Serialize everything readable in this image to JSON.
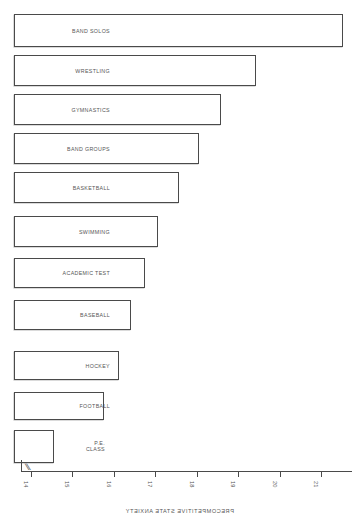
{
  "chart_data": {
    "type": "bar",
    "orientation": "horizontal",
    "title": "",
    "xlabel": "PRECOMPETITIVE STATE ANXIETY",
    "ylabel": "",
    "grid": false,
    "legend": "none",
    "axis_break": true,
    "axis_break_symbol": "//",
    "xlim": [
      14,
      21.8
    ],
    "xticks": [
      21,
      20,
      19,
      18,
      17,
      16,
      15,
      14
    ],
    "xtick_labels": [
      "21",
      "20",
      "19",
      "18",
      "17",
      "16",
      "15",
      "14"
    ],
    "categories": [
      "BAND SOLOS",
      "WRESTLING",
      "GYMNASTICS",
      "BAND GROUPS",
      "BASKETBALL",
      "SWIMMING",
      "ACADEMIC TEST",
      "BASEBALL",
      "HOCKEY",
      "FOOTBALL",
      "P.E.\nCLASS"
    ],
    "values": [
      21.5,
      19.4,
      18.6,
      18.0,
      17.5,
      17.0,
      16.7,
      16.4,
      16.1,
      15.7,
      14.5
    ]
  },
  "bars": [
    {
      "label": "BAND SOLOS",
      "value": 21.5,
      "top": 14,
      "height": 33,
      "left": 16,
      "width": 329,
      "label_x": 249,
      "lines": 1
    },
    {
      "label": "WRESTLING",
      "value": 19.4,
      "top": 55,
      "height": 31,
      "left": 103,
      "width": 242,
      "label_x": 249,
      "lines": 1
    },
    {
      "label": "GYMNASTICS",
      "value": 18.6,
      "top": 94,
      "height": 31,
      "left": 138,
      "width": 207,
      "label_x": 249,
      "lines": 1
    },
    {
      "label": "BAND GROUPS",
      "value": 18.0,
      "top": 133,
      "height": 31,
      "left": 160,
      "width": 185,
      "label_x": 249,
      "lines": 1
    },
    {
      "label": "BASKETBALL",
      "value": 17.5,
      "top": 172,
      "height": 31,
      "left": 180,
      "width": 165,
      "label_x": 249,
      "lines": 1
    },
    {
      "label": "SWIMMING",
      "value": 17.0,
      "top": 216,
      "height": 31,
      "left": 201,
      "width": 144,
      "label_x": 249,
      "lines": 1
    },
    {
      "label": "ACADEMIC TEST",
      "value": 16.7,
      "top": 258,
      "height": 30,
      "left": 214,
      "width": 131,
      "label_x": 249,
      "lines": 1
    },
    {
      "label": "BASEBALL",
      "value": 16.4,
      "top": 300,
      "height": 30,
      "left": 228,
      "width": 117,
      "label_x": 249,
      "lines": 1
    },
    {
      "label": "HOCKEY",
      "value": 16.1,
      "top": 351,
      "height": 29,
      "left": 240,
      "width": 105,
      "label_x": 249,
      "lines": 1
    },
    {
      "label": "FOOTBALL",
      "value": 15.7,
      "top": 392,
      "height": 28,
      "left": 255,
      "width": 90,
      "label_x": 249,
      "lines": 1
    },
    {
      "label": "P.E.\nCLASS",
      "value": 14.5,
      "top": 430,
      "height": 33,
      "left": 305,
      "width": 40,
      "label_x": 254,
      "lines": 2
    }
  ],
  "axis": {
    "title": "PRECOMPETITIVE STATE ANXIETY",
    "break_symbol": "//",
    "ticks": [
      {
        "label": "21",
        "x": 37
      },
      {
        "label": "20",
        "x": 78
      },
      {
        "label": "19",
        "x": 120
      },
      {
        "label": "18",
        "x": 161
      },
      {
        "label": "17",
        "x": 203
      },
      {
        "label": "16",
        "x": 244
      },
      {
        "label": "15",
        "x": 286
      },
      {
        "label": "14",
        "x": 327
      }
    ]
  },
  "colors": {
    "ink": "#4a4a4a",
    "text": "#555555",
    "background": "#ffffff"
  }
}
